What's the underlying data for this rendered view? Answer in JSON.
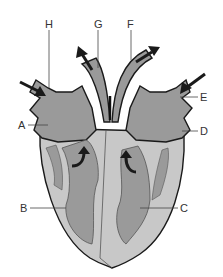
{
  "diagram": {
    "type": "heart-anatomy",
    "labels": {
      "A": "A",
      "B": "B",
      "C": "C",
      "D": "D",
      "E": "E",
      "F": "F",
      "G": "G",
      "H": "H"
    },
    "colors": {
      "chamber": "#9a9a9a",
      "wall": "#c8c8c8",
      "outline": "#1a1a1a",
      "arrow": "#1a1a1a",
      "label_line": "#444444"
    }
  }
}
